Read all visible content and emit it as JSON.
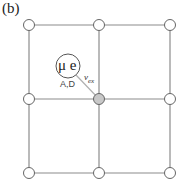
{
  "panel_label": "(b)",
  "defect": {
    "label": "μ e",
    "sublabel": "A,D"
  },
  "hop": {
    "label": "ν",
    "subscript": "ex"
  },
  "colors": {
    "line": "#8c8c8c",
    "node_fill": "#ffffff",
    "center_fill": "#c8c8c8",
    "stroke": "#555555"
  },
  "lattice": {
    "rows": [
      25,
      99,
      173
    ],
    "cols": [
      29,
      99,
      170
    ],
    "highlighted_node": [
      1,
      1
    ]
  }
}
